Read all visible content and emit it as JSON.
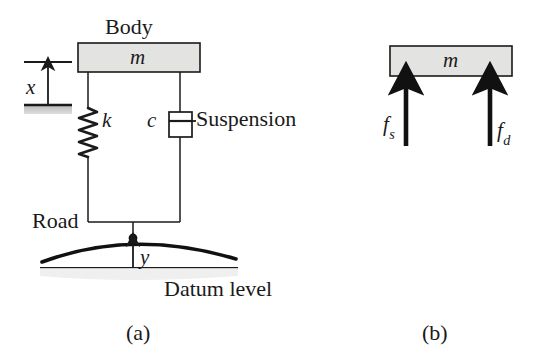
{
  "figure": {
    "background_color": "#ffffff",
    "stroke_color": "#1a1a1a",
    "block_fill_color": "#e3e3e1",
    "ground_fill_color": "#c9c9c7"
  },
  "part_a": {
    "caption": "(a)",
    "body_label": "Body",
    "mass_label": "m",
    "displacement_label": "x",
    "spring_label": "k",
    "damper_label": "c",
    "suspension_label": "Suspension",
    "road_label": "Road",
    "road_displacement_label": "y",
    "datum_label": "Datum level"
  },
  "part_b": {
    "caption": "(b)",
    "mass_label": "m",
    "spring_force_label": "f",
    "spring_force_sub": "s",
    "damper_force_label": "f",
    "damper_force_sub": "d"
  }
}
